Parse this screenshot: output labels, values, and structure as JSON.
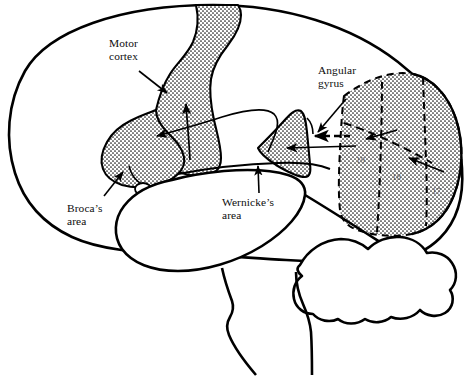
{
  "figure": {
    "background_color": "#ffffff",
    "ink_color": "#000000",
    "stipple_color": "#1a1a1a",
    "width": 473,
    "height": 377
  },
  "labels": {
    "motor_cortex": "Motor\ncortex",
    "brocas_area": "Broca’s\narea",
    "wernickes_area": "Wernicke’s\narea",
    "angular_gyrus": "Angular\ngyrus"
  },
  "brodmann_areas": {
    "area_19": "19",
    "area_18": "18",
    "area_17": "17"
  },
  "regions": [
    {
      "name": "motor-cortex-strip",
      "fill": "stipple",
      "label": "Motor cortex"
    },
    {
      "name": "brocas-area",
      "fill": "stipple",
      "label": "Broca’s area"
    },
    {
      "name": "wernickes-area",
      "fill": "stipple",
      "label": "Wernicke’s area"
    },
    {
      "name": "angular-gyrus",
      "fill": "stipple",
      "label": "Angular gyrus"
    },
    {
      "name": "visual-cortex",
      "fill": "stipple",
      "label": "Visual cortex (areas 17, 18, 19)"
    },
    {
      "name": "temporal-lobe",
      "fill": "none",
      "label": "Temporal lobe"
    },
    {
      "name": "cerebellum",
      "fill": "none",
      "label": "Cerebellum"
    },
    {
      "name": "brainstem",
      "fill": "none",
      "label": "Brainstem"
    }
  ],
  "connectors": [
    {
      "name": "arcuate-fasciculus",
      "style": "solid",
      "from": "Wernicke’s area",
      "to": "Broca’s area"
    },
    {
      "name": "broca-to-motor-cortex",
      "style": "solid",
      "from": "Broca’s area",
      "to": "Motor cortex"
    },
    {
      "name": "visual-to-angular-gyrus-dashed",
      "style": "dashed",
      "from": "Visual cortex",
      "to": "Angular gyrus"
    },
    {
      "name": "visual-to-wernicke",
      "style": "solid",
      "from": "Visual cortex",
      "to": "Wernicke’s area"
    }
  ],
  "leaders": [
    {
      "name": "leader-motor-cortex",
      "label": "Motor cortex",
      "direction": "down-right"
    },
    {
      "name": "leader-brocas-area",
      "label": "Broca’s area",
      "direction": "up-right"
    },
    {
      "name": "leader-wernickes-area",
      "label": "Wernicke’s area",
      "direction": "up"
    },
    {
      "name": "leader-angular-gyrus",
      "label": "Angular gyrus",
      "direction": "down-left"
    }
  ]
}
